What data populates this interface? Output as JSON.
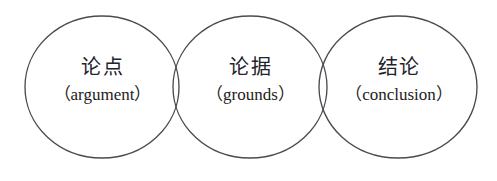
{
  "diagram": {
    "type": "three-overlapping-circles",
    "background_color": "#ffffff",
    "stroke_color": "#4a4a52",
    "text_color": "#1d1d22",
    "nodes": [
      {
        "id": "argument",
        "label_cn": "论点",
        "label_en": "（argument）",
        "circle": {
          "cx": 102,
          "cy": 87,
          "rx": 77,
          "ry": 71
        }
      },
      {
        "id": "grounds",
        "label_cn": "论据",
        "label_en": "（grounds）",
        "circle": {
          "cx": 250,
          "cy": 87,
          "rx": 77,
          "ry": 71
        }
      },
      {
        "id": "conclusion",
        "label_cn": "结论",
        "label_en": "（conclusion）",
        "circle": {
          "cx": 398,
          "cy": 87,
          "rx": 79,
          "ry": 71
        }
      }
    ]
  }
}
